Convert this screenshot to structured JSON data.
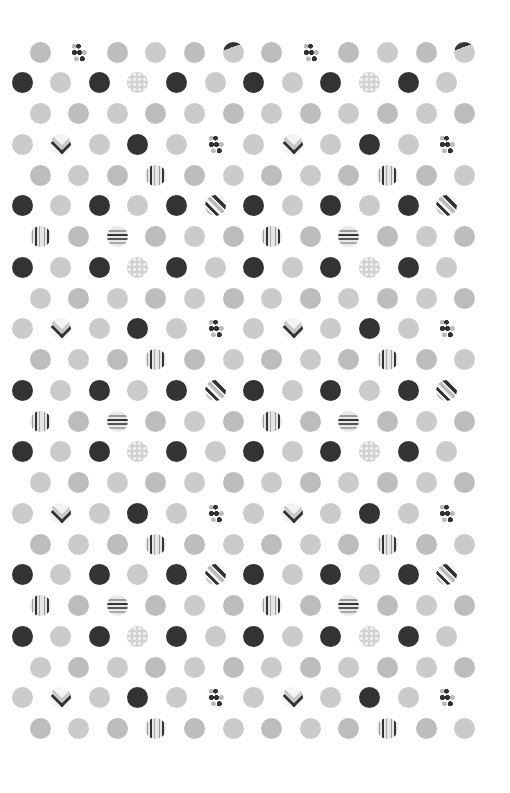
{
  "pattern": {
    "background": "#ffffff",
    "colors": {
      "dark": "#333333",
      "light": "#cbcbcb",
      "medium": "#bdbdbd"
    },
    "dot_diameter": 21,
    "row_start_y": 52,
    "row_step_y": 30.75,
    "col_step_x": 38.6,
    "row_offsets_x": {
      "even_index": 40,
      "odd_index": 22
    },
    "legend": {
      "D": "solid dark circle",
      "L": "solid light gray circle",
      "M": "solid medium gray circle",
      "P": "light gray circle with white polka dots",
      "VS": "vertical stripes circle",
      "HS": "horizontal stripes circle",
      "DIAG": "diagonal stripes circle",
      "DIAGTOP": "gray circle with dark top-left segment",
      "CH": "chevron circle",
      "DOTS": "cluster of small dots"
    },
    "rows": [
      [
        "M",
        "DOTS",
        "M",
        "L",
        "M",
        "DIAGTOP",
        "M",
        "DOTS",
        "M",
        "L",
        "M",
        "DIAGTOP"
      ],
      [
        "D",
        "L",
        "D",
        "P",
        "D",
        "L",
        "D",
        "L",
        "D",
        "P",
        "D",
        "L"
      ],
      [
        "L",
        "M",
        "L",
        "M",
        "L",
        "M",
        "L",
        "M",
        "L",
        "M",
        "L",
        "M"
      ],
      [
        "L",
        "CH",
        "L",
        "D",
        "L",
        "DOTS",
        "L",
        "CH",
        "L",
        "D",
        "L",
        "DOTS"
      ],
      [
        "M",
        "L",
        "M",
        "VS",
        "M",
        "L",
        "M",
        "L",
        "M",
        "VS",
        "M",
        "L"
      ],
      [
        "D",
        "L",
        "D",
        "L",
        "D",
        "DIAG",
        "D",
        "L",
        "D",
        "L",
        "D",
        "DIAG"
      ],
      [
        "VS",
        "M",
        "HS",
        "M",
        "L",
        "M",
        "VS",
        "M",
        "HS",
        "M",
        "L",
        "M"
      ],
      [
        "D",
        "L",
        "D",
        "P",
        "D",
        "L",
        "D",
        "L",
        "D",
        "P",
        "D",
        "L"
      ],
      [
        "L",
        "M",
        "L",
        "M",
        "L",
        "M",
        "L",
        "M",
        "L",
        "M",
        "L",
        "M"
      ],
      [
        "L",
        "CH",
        "L",
        "D",
        "L",
        "DOTS",
        "L",
        "CH",
        "L",
        "D",
        "L",
        "DOTS"
      ],
      [
        "M",
        "L",
        "M",
        "VS",
        "M",
        "L",
        "M",
        "L",
        "M",
        "VS",
        "M",
        "L"
      ],
      [
        "D",
        "L",
        "D",
        "L",
        "D",
        "DIAG",
        "D",
        "L",
        "D",
        "L",
        "D",
        "DIAG"
      ],
      [
        "VS",
        "M",
        "HS",
        "M",
        "L",
        "M",
        "VS",
        "M",
        "HS",
        "M",
        "L",
        "M"
      ],
      [
        "D",
        "L",
        "D",
        "P",
        "D",
        "L",
        "D",
        "L",
        "D",
        "P",
        "D",
        "L"
      ],
      [
        "L",
        "M",
        "L",
        "M",
        "L",
        "M",
        "L",
        "M",
        "L",
        "M",
        "L",
        "M"
      ],
      [
        "L",
        "CH",
        "L",
        "D",
        "L",
        "DOTS",
        "L",
        "CH",
        "L",
        "D",
        "L",
        "DOTS"
      ],
      [
        "M",
        "L",
        "M",
        "VS",
        "M",
        "L",
        "M",
        "L",
        "M",
        "VS",
        "M",
        "L"
      ],
      [
        "D",
        "L",
        "D",
        "L",
        "D",
        "DIAG",
        "D",
        "L",
        "D",
        "L",
        "D",
        "DIAG"
      ],
      [
        "VS",
        "M",
        "HS",
        "M",
        "L",
        "M",
        "VS",
        "M",
        "HS",
        "M",
        "L",
        "M"
      ],
      [
        "D",
        "L",
        "D",
        "P",
        "D",
        "L",
        "D",
        "L",
        "D",
        "P",
        "D",
        "L"
      ],
      [
        "L",
        "M",
        "L",
        "M",
        "L",
        "M",
        "L",
        "M",
        "L",
        "M",
        "L",
        "M"
      ],
      [
        "L",
        "CH",
        "L",
        "D",
        "L",
        "DOTS",
        "L",
        "CH",
        "L",
        "D",
        "L",
        "DOTS"
      ],
      [
        "M",
        "L",
        "M",
        "VS",
        "M",
        "L",
        "M",
        "L",
        "M",
        "VS",
        "M",
        "L"
      ]
    ]
  }
}
